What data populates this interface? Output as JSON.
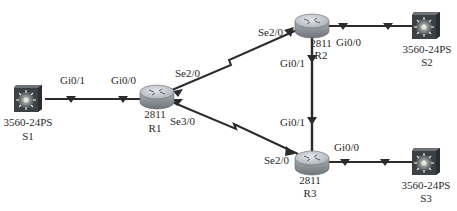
{
  "diagram": {
    "type": "network-topology",
    "devices": [
      {
        "id": "S1",
        "model": "3560-24PS",
        "name": "S1",
        "kind": "switch"
      },
      {
        "id": "R1",
        "model": "2811",
        "name": "R1",
        "kind": "router"
      },
      {
        "id": "R2",
        "model": "2811",
        "name": "R2",
        "kind": "router"
      },
      {
        "id": "R3",
        "model": "2811",
        "name": "R3",
        "kind": "router"
      },
      {
        "id": "S2",
        "model": "3560-24PS",
        "name": "S2",
        "kind": "switch"
      },
      {
        "id": "S3",
        "model": "3560-24PS",
        "name": "S3",
        "kind": "switch"
      }
    ],
    "links": [
      {
        "from": "S1",
        "from_port": "Gi0/1",
        "to": "R1",
        "to_port": "Gi0/0",
        "type": "ethernet"
      },
      {
        "from": "R1",
        "from_port": "Se2/0",
        "to": "R2",
        "to_port": "Se2/0",
        "type": "serial"
      },
      {
        "from": "R1",
        "from_port": "Se3/0",
        "to": "R3",
        "to_port": "Se2/0",
        "type": "serial"
      },
      {
        "from": "R2",
        "from_port": "Gi0/1",
        "to": "R3",
        "to_port": "Gi0/1",
        "type": "ethernet"
      },
      {
        "from": "R2",
        "from_port": "Gi0/0",
        "to": "S2",
        "to_port": "",
        "type": "ethernet"
      },
      {
        "from": "R3",
        "from_port": "Gi0/0",
        "to": "S3",
        "to_port": "",
        "type": "ethernet"
      }
    ],
    "port_labels": {
      "s1_gi01": "Gi0/1",
      "r1_gi00": "Gi0/0",
      "r1_se20": "Se2/0",
      "r1_se30": "Se3/0",
      "r2_se20": "Se2/0",
      "r2_gi00": "Gi0/0",
      "r2_gi01": "Gi0/1",
      "r3_gi01": "Gi0/1",
      "r3_se20": "Se2/0",
      "r3_gi00": "Gi0/0"
    },
    "colors": {
      "link": "#2b2b2b",
      "router_top": "#c9cdd2",
      "router_side": "#8a9096",
      "switch_body": "#3a3f44",
      "text": "#2a2a2a"
    }
  }
}
